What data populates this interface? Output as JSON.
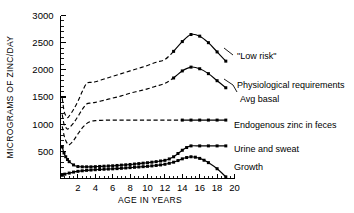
{
  "chart_data": {
    "type": "line",
    "title": "",
    "xlabel": "AGE IN YEARS",
    "ylabel": "MICROGRAMS OF ZINC/DAY",
    "xlim": [
      0,
      20
    ],
    "ylim": [
      0,
      3000
    ],
    "grid": false,
    "legend_position": "right-inline-annotations",
    "x_ticks_major": [
      2,
      4,
      6,
      8,
      10,
      12,
      14,
      16,
      18,
      20
    ],
    "x_tick_labels": [
      "2",
      "4",
      "6",
      "8",
      "10",
      "12",
      "14",
      "16",
      "18",
      "20"
    ],
    "x_minor_step": 0.5,
    "y_ticks_major": [
      0,
      500,
      1000,
      1500,
      2000,
      2500,
      3000
    ],
    "y_tick_labels": [
      "",
      "500",
      "1000",
      "1500",
      "2000",
      "2500",
      "3000"
    ],
    "y_minor_step": 100,
    "marker_style": "filled-square",
    "dash_note": "Curves drawn dashed over the unmarked age range and solid with square markers from about age 13 onward.",
    "series": [
      {
        "name": "\"Low risk\"",
        "label": "\"Low risk\"",
        "style": "dashed-then-marked",
        "x": [
          0.2,
          0.4,
          0.6,
          0.8,
          1.0,
          1.5,
          2.0,
          2.5,
          3.0,
          3.5,
          4.0,
          5.0,
          6.0,
          7.0,
          8.0,
          9.0,
          10.0,
          11.0,
          12.0,
          13.0,
          14.0,
          15.0,
          16.0,
          17.0,
          18.0,
          19.0
        ],
        "y": [
          1480,
          1250,
          1160,
          1120,
          1150,
          1270,
          1420,
          1600,
          1750,
          1770,
          1780,
          1830,
          1880,
          1930,
          1980,
          2030,
          2080,
          2140,
          2190,
          2340,
          2520,
          2650,
          2620,
          2500,
          2330,
          2160
        ],
        "marked_from_index": 19,
        "label_xy": [
          20.2,
          2230
        ]
      },
      {
        "name": "Physiological requirements",
        "label": "Physiological requirements",
        "style": "dashed-then-marked",
        "x": [
          0.2,
          0.4,
          0.6,
          0.8,
          1.0,
          1.5,
          2.0,
          2.5,
          3.0,
          3.5,
          4.0,
          5.0,
          6.0,
          7.0,
          8.0,
          9.0,
          10.0,
          11.0,
          12.0,
          13.0,
          14.0,
          15.0,
          16.0,
          17.0,
          18.0,
          19.0
        ],
        "y": [
          1180,
          1000,
          940,
          910,
          930,
          1020,
          1140,
          1270,
          1370,
          1390,
          1400,
          1440,
          1480,
          1520,
          1570,
          1610,
          1650,
          1700,
          1750,
          1850,
          1980,
          2050,
          2020,
          1930,
          1800,
          1670
        ],
        "marked_from_index": 19,
        "label_xy": [
          20.2,
          1810
        ],
        "secondary_label": "Avg basal"
      },
      {
        "name": "Endogenous zinc in feces",
        "label": "Endogenous zinc in feces",
        "style": "dashed-then-marked",
        "x": [
          0.2,
          0.4,
          0.6,
          0.8,
          1.0,
          1.5,
          2.0,
          2.5,
          3.0,
          3.5,
          4.0,
          5.0,
          6.0,
          7.0,
          8.0,
          9.0,
          10.0,
          11.0,
          12.0,
          13.0,
          14.0,
          15.0,
          16.0,
          17.0,
          18.0,
          19.0
        ],
        "y": [
          960,
          800,
          700,
          640,
          620,
          700,
          820,
          930,
          1010,
          1050,
          1065,
          1072,
          1075,
          1075,
          1075,
          1075,
          1075,
          1075,
          1075,
          1075,
          1075,
          1075,
          1075,
          1075,
          1075,
          1075
        ],
        "marked_from_index": 20,
        "label_xy": [
          20.2,
          940
        ]
      },
      {
        "name": "Urine and sweat",
        "label": "Urine and sweat",
        "style": "solid-marked",
        "x": [
          0.2,
          0.4,
          0.6,
          0.8,
          1.0,
          1.5,
          2.0,
          2.5,
          3.0,
          3.5,
          4.0,
          4.5,
          5.0,
          5.5,
          6.0,
          6.5,
          7.0,
          7.5,
          8.0,
          8.5,
          9.0,
          9.5,
          10.0,
          10.5,
          11.0,
          11.5,
          12.0,
          12.5,
          13.0,
          13.5,
          14.0,
          14.5,
          15.0,
          16.0,
          17.0,
          18.0,
          19.0
        ],
        "y": [
          580,
          470,
          400,
          350,
          310,
          250,
          220,
          215,
          215,
          215,
          218,
          222,
          226,
          230,
          234,
          240,
          246,
          252,
          258,
          266,
          274,
          282,
          290,
          300,
          310,
          322,
          334,
          360,
          400,
          460,
          520,
          570,
          600,
          600,
          600,
          600,
          600
        ],
        "marked_from_index": 0,
        "label_xy": [
          20.2,
          600
        ]
      },
      {
        "name": "Growth",
        "label": "Growth",
        "style": "solid-marked",
        "x": [
          0.2,
          0.5,
          1.0,
          1.5,
          2.0,
          2.5,
          3.0,
          3.5,
          4.0,
          4.5,
          5.0,
          5.5,
          6.0,
          6.5,
          7.0,
          7.5,
          8.0,
          8.5,
          9.0,
          9.5,
          10.0,
          10.5,
          11.0,
          11.5,
          12.0,
          12.5,
          13.0,
          13.5,
          14.0,
          14.5,
          15.0,
          15.5,
          16.0,
          16.5,
          17.0,
          18.0,
          19.0
        ],
        "y": [
          60,
          80,
          100,
          118,
          132,
          142,
          150,
          156,
          162,
          166,
          170,
          174,
          178,
          182,
          188,
          194,
          200,
          206,
          212,
          218,
          224,
          232,
          240,
          250,
          262,
          280,
          300,
          330,
          362,
          386,
          400,
          392,
          370,
          336,
          292,
          180,
          30
        ],
        "marked_from_index": 0,
        "label_xy": [
          20.2,
          300
        ]
      }
    ]
  },
  "axes": {
    "y_axis_title": "MICROGRAMS OF ZINC/DAY",
    "x_axis_title": "AGE IN YEARS"
  },
  "annotations": {
    "low_risk": "\"Low risk\"",
    "physiological_requirements": "Physiological requirements",
    "avg_basal": "Avg basal",
    "endogenous_zinc": "Endogenous zinc in feces",
    "urine_and_sweat": "Urine and sweat",
    "growth": "Growth"
  },
  "colors": {
    "ink": "#000000",
    "background": "#ffffff"
  }
}
